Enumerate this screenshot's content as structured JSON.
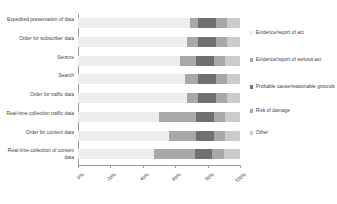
{
  "chart_data": {
    "type": "bar",
    "orientation": "horizontal",
    "stacked": true,
    "normalized": "100%",
    "title": "",
    "xlabel": "",
    "ylabel": "",
    "xlim": [
      0,
      100
    ],
    "grid": false,
    "legend_position": "right",
    "tick_labels": [
      "0%",
      "20%",
      "40%",
      "60%",
      "80%",
      "100%"
    ],
    "tick_values": [
      0,
      20,
      40,
      60,
      80,
      100
    ],
    "categories": [
      "Expedited preservation of data",
      "Order for subscriber data",
      "Seizure",
      "Search",
      "Order for traffic data",
      "Real-time collection traffic data",
      "Order for content data",
      "Real-time collection of content data"
    ],
    "series": [
      {
        "name": "Evidence/report of act",
        "color": "#eceded",
        "values": [
          69,
          67,
          63,
          66,
          67,
          50,
          56,
          47
        ]
      },
      {
        "name": "Evidence/report of serious act",
        "color": "#a6a8aa",
        "values": [
          5,
          7,
          10,
          8,
          7,
          23,
          17,
          25
        ]
      },
      {
        "name": "Probable cause/reasonable grounds",
        "color": "#6e7072",
        "values": [
          11,
          11,
          11,
          11,
          11,
          11,
          11,
          11
        ]
      },
      {
        "name": "Risk of damage",
        "color": "#a6a8aa",
        "values": [
          7,
          7,
          7,
          7,
          7,
          7,
          7,
          7
        ]
      },
      {
        "name": "Other",
        "color": "#c9cbcc",
        "values": [
          8,
          8,
          9,
          8,
          8,
          9,
          9,
          10
        ]
      }
    ]
  }
}
